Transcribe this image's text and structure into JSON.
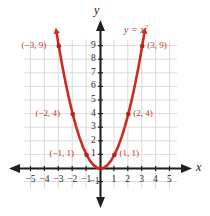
{
  "chart_data": {
    "type": "line",
    "title": "",
    "equation_label": "y = x²",
    "xlabel": "x",
    "ylabel": "y",
    "xlim": [
      -5.8,
      5.8
    ],
    "ylim": [
      -1.8,
      10.2
    ],
    "grid": true,
    "grid_x_range": [
      -5.5,
      5.5
    ],
    "grid_y_range": [
      -1.5,
      9.5
    ],
    "legend": "none",
    "x_ticks": [
      -5,
      -4,
      -3,
      -2,
      -1,
      1,
      2,
      3,
      4,
      5
    ],
    "x_tick_labels": [
      "−5",
      "−4",
      "−3",
      "−2",
      "−1",
      "1",
      "2",
      "3",
      "4",
      "5"
    ],
    "y_ticks": [
      -1,
      1,
      2,
      3,
      4,
      5,
      6,
      7,
      8,
      9
    ],
    "y_tick_labels": [
      "−1",
      "1",
      "2",
      "3",
      "4",
      "5",
      "6",
      "7",
      "8",
      "9"
    ],
    "curve": {
      "name": "y = x^2",
      "x": [
        -3.15,
        -3.0,
        -2.75,
        -2.5,
        -2.25,
        -2.0,
        -1.75,
        -1.5,
        -1.25,
        -1.0,
        -0.75,
        -0.5,
        -0.25,
        0,
        0.25,
        0.5,
        0.75,
        1.0,
        1.25,
        1.5,
        1.75,
        2.0,
        2.25,
        2.5,
        2.75,
        3.0,
        3.15
      ],
      "y": [
        9.92,
        9.0,
        7.5625,
        6.25,
        5.0625,
        4.0,
        3.0625,
        2.25,
        1.5625,
        1.0,
        0.5625,
        0.25,
        0.0625,
        0,
        0.0625,
        0.25,
        0.5625,
        1.0,
        1.5625,
        2.25,
        3.0625,
        4.0,
        5.0625,
        6.25,
        7.5625,
        9.0,
        9.92
      ]
    },
    "points": [
      {
        "x": -3,
        "y": 9,
        "label": "(−3, 9)",
        "label_side": "left"
      },
      {
        "x": -2,
        "y": 4,
        "label": "(−2, 4)",
        "label_side": "left"
      },
      {
        "x": -1,
        "y": 1,
        "label": "(−1, 1)",
        "label_side": "left"
      },
      {
        "x": 1,
        "y": 1,
        "label": "(1, 1)",
        "label_side": "right"
      },
      {
        "x": 2,
        "y": 4,
        "label": "(2, 4)",
        "label_side": "right"
      },
      {
        "x": 3,
        "y": 9,
        "label": "(3, 9)",
        "label_side": "right"
      }
    ],
    "colors": {
      "curve": "#cc2b22",
      "point": "#b3241c",
      "point_label": "#c0392b",
      "axis": "#231f20",
      "grid": "#d9d6d4",
      "tick_label": "#2b2b2b",
      "background": "#ffffff"
    }
  }
}
